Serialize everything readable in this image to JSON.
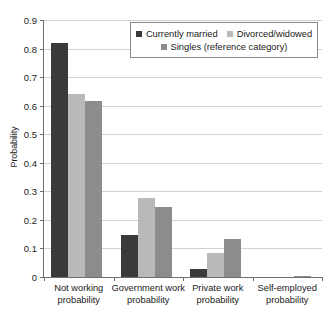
{
  "chart_data": {
    "type": "bar",
    "title": "",
    "subtitle": "",
    "xlabel": "",
    "ylabel": "Probability",
    "ylim": [
      0,
      0.9
    ],
    "ytick_labels": [
      "0.9",
      "0.8",
      "0.7",
      "0.6",
      "0.5",
      "0.4",
      "0.3",
      "0.2",
      "0.1",
      "0"
    ],
    "ytick_values": [
      0.9,
      0.8,
      0.7,
      0.6,
      0.5,
      0.4,
      0.3,
      0.2,
      0.1,
      0
    ],
    "grid": true,
    "legend_position": "top-right",
    "categories": [
      "Not working probability",
      "Government work probability",
      "Private work probability",
      "Self-employed probability"
    ],
    "category_lines": [
      [
        "Not working",
        "probability"
      ],
      [
        "Government work",
        "probability"
      ],
      [
        "Private work",
        "probability"
      ],
      [
        "Self-employed",
        "probability"
      ]
    ],
    "series": [
      {
        "name": "Currently married",
        "color": "#3a3a3a",
        "values": [
          0.82,
          0.147,
          0.028,
          0.0
        ]
      },
      {
        "name": "Divorced/widowed",
        "color": "#b9b9b9",
        "values": [
          0.64,
          0.275,
          0.083,
          0.0
        ]
      },
      {
        "name": "Singles (reference category)",
        "color": "#8c8c8c",
        "values": [
          0.615,
          0.245,
          0.133,
          0.002
        ]
      }
    ]
  },
  "colors": {
    "background": "#ffffff",
    "axis": "#6f6f6f",
    "gridline": "#d2d2d2",
    "text": "#1a1a1a",
    "legend_border": "#8a8a8a"
  }
}
